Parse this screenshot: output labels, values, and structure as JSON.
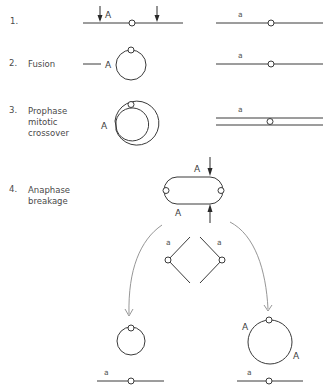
{
  "steps": [
    {
      "number": "1.",
      "label": ""
    },
    {
      "number": "2.",
      "label": "Fusion"
    },
    {
      "number": "3.",
      "label_lines": [
        "Prophase",
        "mitotic",
        "crossover"
      ]
    },
    {
      "number": "4.",
      "label_lines": [
        "Anaphase",
        "breakage"
      ]
    }
  ],
  "alleles": {
    "dominant": "A",
    "recessive": "a"
  },
  "colors": {
    "line": "#3a3a3a",
    "text": "#4a4a4a",
    "arrow_curve": "#8a8a8a"
  }
}
